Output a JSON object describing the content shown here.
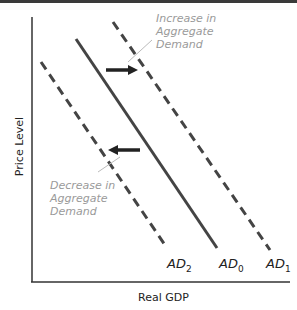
{
  "diagram": {
    "type": "aggregate-demand-shift",
    "x_axis_label": "Real GDP",
    "y_axis_label": "Price Level",
    "curves": [
      {
        "name": "AD",
        "subscript": "2",
        "style": "dashed"
      },
      {
        "name": "AD",
        "subscript": "0",
        "style": "solid"
      },
      {
        "name": "AD",
        "subscript": "1",
        "style": "dashed"
      }
    ],
    "annotations": {
      "increase": [
        "Increase in",
        "Aggregate",
        "Demand"
      ],
      "decrease": [
        "Decrease in",
        "Aggregate",
        "Demand"
      ]
    },
    "colors": {
      "curve": "#444444",
      "annotation": "#9a9a9a",
      "axis": "#333333"
    }
  }
}
